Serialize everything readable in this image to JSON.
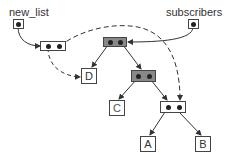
{
  "diagram": {
    "type": "persistent-tree-structure-sharing",
    "labels": {
      "new_list": "new_list",
      "subscribers": "subscribers"
    },
    "nodes": {
      "D": "D",
      "C": "C",
      "A": "A",
      "B": "B"
    },
    "colors": {
      "shared_node": "#888888",
      "new_node": "#ffffff",
      "stroke": "#444444"
    },
    "edges": [
      {
        "from": "new_list",
        "to": "cons-cell",
        "style": "solid"
      },
      {
        "from": "cons-cell.left",
        "to": "D",
        "style": "dashed"
      },
      {
        "from": "cons-cell.right",
        "to": "pair-AB",
        "style": "dashed"
      },
      {
        "from": "subscribers",
        "to": "root",
        "style": "solid"
      },
      {
        "from": "root.left",
        "to": "D",
        "style": "solid"
      },
      {
        "from": "root.right",
        "to": "mid",
        "style": "solid"
      },
      {
        "from": "mid.left",
        "to": "C",
        "style": "solid"
      },
      {
        "from": "mid.right",
        "to": "pair-AB",
        "style": "solid"
      },
      {
        "from": "pair-AB.left",
        "to": "A",
        "style": "solid"
      },
      {
        "from": "pair-AB.right",
        "to": "B",
        "style": "solid"
      }
    ]
  }
}
